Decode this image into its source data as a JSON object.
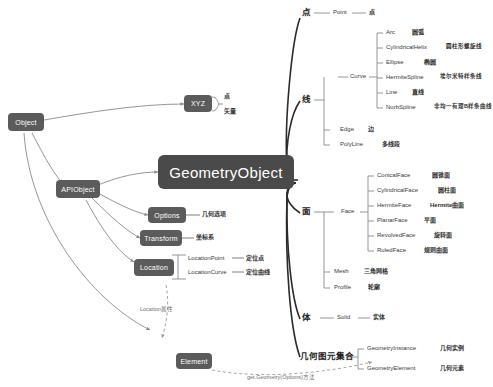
{
  "diagram": {
    "title": "GeometryObject",
    "background": "#ffffff",
    "node_color": "#5b5b5b",
    "root_color": "#4a4a4a",
    "line_color": "#8a8a8a"
  },
  "nodes": {
    "object": "Object",
    "apiobject": "APIObject",
    "geometryobject": "GeometryObject",
    "xyz": "XYZ",
    "options": "Options",
    "transform": "Transform",
    "location": "Location",
    "element": "Element"
  },
  "xyz_children": [
    {
      "label": "点"
    },
    {
      "label": "矢量"
    }
  ],
  "side_labels": {
    "options_cn": "几何选项",
    "transform_cn": "坐标系"
  },
  "location_children": [
    {
      "en": "LocationPoint",
      "cn": "定位点"
    },
    {
      "en": "LocationCurve",
      "cn": "定位曲线"
    }
  ],
  "annotations": {
    "location_attr": "Location属性",
    "get_geometry": "get.Geometry(Options)方法"
  },
  "branches": [
    {
      "name": "点",
      "y": 13,
      "items": [
        {
          "en": "Point",
          "cn": "点",
          "y": 13
        }
      ]
    },
    {
      "name": "线",
      "y": 100,
      "group": {
        "label": "Curve",
        "y": 77,
        "children": [
          {
            "en": "Arc",
            "cn": "圆弧",
            "y": 33
          },
          {
            "en": "CylindricalHelix",
            "cn": "圆柱形螺旋线",
            "y": 48
          },
          {
            "en": "Ellipse",
            "cn": "椭圆",
            "y": 63
          },
          {
            "en": "HermiteSpline",
            "cn": "埃尔米特样条线",
            "y": 78
          },
          {
            "en": "Line",
            "cn": "直线",
            "y": 93
          },
          {
            "en": "NurbSpline",
            "cn": "非均一有理B样条曲线",
            "y": 108
          }
        ]
      },
      "extras": [
        {
          "en": "Edge",
          "cn": "边",
          "y": 130
        },
        {
          "en": "PolyLine",
          "cn": "多线段",
          "y": 145
        }
      ]
    },
    {
      "name": "面",
      "y": 212,
      "group": {
        "label": "Face",
        "y": 212,
        "children": [
          {
            "en": "ConicalFace",
            "cn": "圆锥面",
            "y": 176
          },
          {
            "en": "CylindricalFace",
            "cn": "圆柱面",
            "y": 191
          },
          {
            "en": "HermiteFace",
            "cn": "Hermite曲面",
            "y": 206
          },
          {
            "en": "PlanarFace",
            "cn": "平面",
            "y": 221
          },
          {
            "en": "RevolvedFace",
            "cn": "旋转面",
            "y": 236
          },
          {
            "en": "RuledFace",
            "cn": "规则曲面",
            "y": 251
          }
        ]
      },
      "extras": [
        {
          "en": "Mesh",
          "cn": "三角网格",
          "y": 272
        },
        {
          "en": "Profile",
          "cn": "轮廓",
          "y": 288
        }
      ]
    },
    {
      "name": "体",
      "y": 318,
      "items": [
        {
          "en": "Solid",
          "cn": "实体",
          "y": 318
        }
      ]
    },
    {
      "name": "几何图元集合",
      "y": 357,
      "items": [
        {
          "en": "GeometryInstance",
          "cn": "几何实例",
          "y": 349
        },
        {
          "en": "GeometryElement",
          "cn": "几何元素",
          "y": 369
        }
      ]
    }
  ]
}
